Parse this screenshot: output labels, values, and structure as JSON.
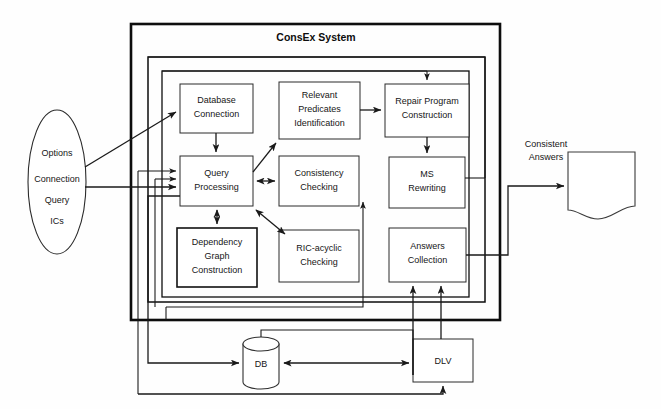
{
  "figure": {
    "title": "ConsEx System",
    "width": 661,
    "height": 409
  },
  "input_source": {
    "name": "input-parameters-ellipse",
    "lines": [
      "Options",
      "Connection",
      "Query",
      "ICs"
    ]
  },
  "output_sink": {
    "name": "consistent-answers-document",
    "label_line1": "Consistent",
    "label_line2": "Answers"
  },
  "nodes": [
    {
      "id": "database-connection",
      "line1": "Database",
      "line2": "Connection",
      "line3": ""
    },
    {
      "id": "relevant-predicates",
      "line1": "Relevant",
      "line2": "Predicates",
      "line3": "Identification"
    },
    {
      "id": "repair-program",
      "line1": "Repair Program",
      "line2": "Construction",
      "line3": ""
    },
    {
      "id": "query-processing",
      "line1": "Query",
      "line2": "Processing",
      "line3": ""
    },
    {
      "id": "consistency-checking",
      "line1": "Consistency",
      "line2": "Checking",
      "line3": ""
    },
    {
      "id": "ms-rewriting",
      "line1": "MS",
      "line2": "Rewriting",
      "line3": ""
    },
    {
      "id": "dependency-graph",
      "line1": "Dependency",
      "line2": "Graph",
      "line3": "Construction"
    },
    {
      "id": "ric-acyclic-checking",
      "line1": "RIC-acyclic",
      "line2": "Checking",
      "line3": ""
    },
    {
      "id": "answers-collection",
      "line1": "Answers",
      "line2": "Collection",
      "line3": ""
    },
    {
      "id": "db-store",
      "line1": "DB",
      "line2": "",
      "line3": ""
    },
    {
      "id": "dlv-solver",
      "line1": "DLV",
      "line2": "",
      "line3": ""
    }
  ],
  "colors": {
    "ink": "#1a1a1a",
    "background": "#ffffff",
    "frame": "#0d0d0d"
  }
}
